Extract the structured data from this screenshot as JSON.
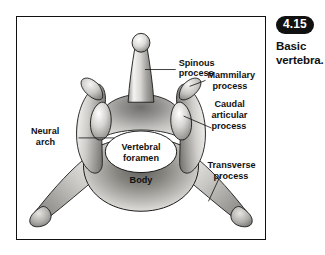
{
  "figure": {
    "badge": "4.15",
    "caption_line1": "Basic",
    "caption_line2": "vertebra."
  },
  "diagram": {
    "title": "Basic vertebra",
    "type": "anatomical-illustration",
    "labels": [
      {
        "id": "spinous-process",
        "line1": "Spinous",
        "line2": "process",
        "line3": ""
      },
      {
        "id": "mammilary-process",
        "line1": "Mammilary",
        "line2": "process",
        "line3": ""
      },
      {
        "id": "caudal-articular-process",
        "line1": "Caudal",
        "line2": "articular",
        "line3": "process"
      },
      {
        "id": "neural-arch",
        "line1": "Neural",
        "line2": "arch",
        "line3": ""
      },
      {
        "id": "vertebral-foramen",
        "line1": "Vertebral",
        "line2": "foramen",
        "line3": ""
      },
      {
        "id": "transverse-process",
        "line1": "Transverse",
        "line2": "process",
        "line3": ""
      },
      {
        "id": "body",
        "line1": "Body",
        "line2": "",
        "line3": ""
      }
    ],
    "colors": {
      "bone_light": "#f2f1ef",
      "bone_mid": "#bdbcb9",
      "bone_dark": "#6e6d6b",
      "outline": "#1a1a1a",
      "border": "#111111",
      "badge_bg": "#111111",
      "badge_text": "#ffffff",
      "background": "#ffffff"
    }
  }
}
